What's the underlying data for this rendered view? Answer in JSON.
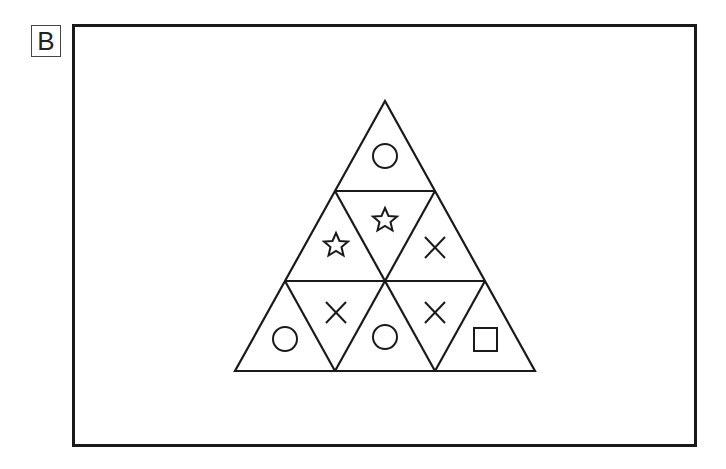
{
  "panel_label": "B",
  "diagram": {
    "type": "triangular puzzle grid",
    "rows": 3,
    "cells": [
      {
        "row": 1,
        "position": 1,
        "orientation": "up",
        "symbol": "circle"
      },
      {
        "row": 2,
        "position": 1,
        "orientation": "up",
        "symbol": "star"
      },
      {
        "row": 2,
        "position": 2,
        "orientation": "down",
        "symbol": "star"
      },
      {
        "row": 2,
        "position": 3,
        "orientation": "up",
        "symbol": "cross"
      },
      {
        "row": 3,
        "position": 1,
        "orientation": "up",
        "symbol": "circle"
      },
      {
        "row": 3,
        "position": 2,
        "orientation": "down",
        "symbol": "cross"
      },
      {
        "row": 3,
        "position": 3,
        "orientation": "up",
        "symbol": "circle"
      },
      {
        "row": 3,
        "position": 4,
        "orientation": "down",
        "symbol": "cross"
      },
      {
        "row": 3,
        "position": 5,
        "orientation": "up",
        "symbol": "square"
      }
    ]
  },
  "colors": {
    "stroke": "#1a1a1a",
    "background": "#ffffff"
  }
}
